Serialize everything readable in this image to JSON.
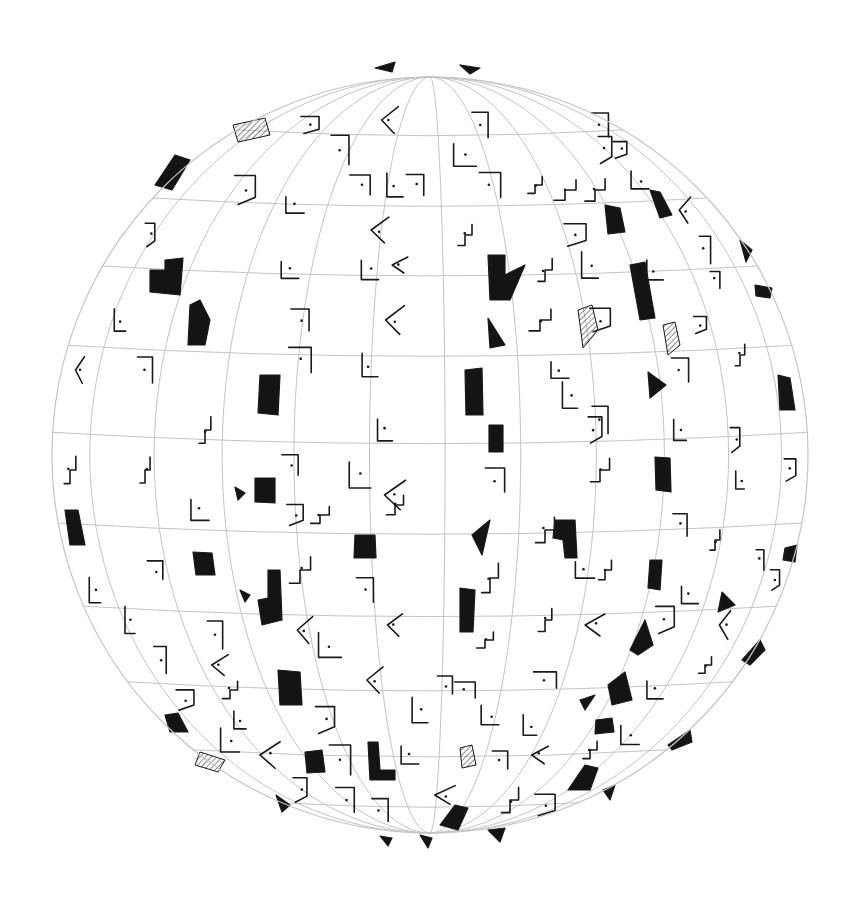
{
  "artwork": {
    "subject": "pencil sketch of a sphere with latitude/longitude grid and scattered geometric marks",
    "colors": {
      "background": "#ffffff",
      "grid": "#c4c4c4",
      "ink": "#1a1a1a",
      "fill": "#141414"
    },
    "sphere": {
      "cx": 430,
      "cy": 455,
      "r": 378
    },
    "latitudes": [
      -0.86,
      -0.68,
      -0.5,
      -0.29,
      -0.06,
      0.18,
      0.4,
      0.6,
      0.78,
      0.92
    ],
    "longitudes": [
      -0.9,
      -0.73,
      -0.55,
      -0.36,
      -0.16,
      0.04,
      0.24,
      0.44,
      0.62,
      0.79,
      0.93
    ],
    "filled_shapes": [
      [
        [
          155,
          185
        ],
        [
          175,
          155
        ],
        [
          190,
          160
        ],
        [
          172,
          190
        ]
      ],
      [
        [
          150,
          270
        ],
        [
          165,
          270
        ],
        [
          165,
          260
        ],
        [
          183,
          258
        ],
        [
          180,
          295
        ],
        [
          150,
          292
        ]
      ],
      [
        [
          190,
          305
        ],
        [
          200,
          300
        ],
        [
          210,
          320
        ],
        [
          205,
          345
        ],
        [
          188,
          345
        ]
      ],
      [
        [
          260,
          375
        ],
        [
          280,
          375
        ],
        [
          278,
          415
        ],
        [
          258,
          413
        ]
      ],
      [
        [
          255,
          478
        ],
        [
          275,
          478
        ],
        [
          275,
          503
        ],
        [
          255,
          502
        ]
      ],
      [
        [
          65,
          510
        ],
        [
          78,
          510
        ],
        [
          85,
          545
        ],
        [
          70,
          545
        ]
      ],
      [
        [
          193,
          552
        ],
        [
          212,
          553
        ],
        [
          215,
          575
        ],
        [
          196,
          575
        ]
      ],
      [
        [
          355,
          535
        ],
        [
          375,
          535
        ],
        [
          376,
          558
        ],
        [
          354,
          558
        ]
      ],
      [
        [
          268,
          570
        ],
        [
          280,
          570
        ],
        [
          282,
          620
        ],
        [
          262,
          625
        ],
        [
          258,
          600
        ],
        [
          268,
          598
        ]
      ],
      [
        [
          278,
          670
        ],
        [
          300,
          672
        ],
        [
          302,
          705
        ],
        [
          280,
          705
        ]
      ],
      [
        [
          465,
          370
        ],
        [
          482,
          368
        ],
        [
          483,
          415
        ],
        [
          466,
          415
        ]
      ],
      [
        [
          489,
          425
        ],
        [
          503,
          425
        ],
        [
          503,
          452
        ],
        [
          489,
          452
        ]
      ],
      [
        [
          488,
          255
        ],
        [
          505,
          255
        ],
        [
          505,
          275
        ],
        [
          525,
          265
        ],
        [
          510,
          300
        ],
        [
          490,
          300
        ]
      ],
      [
        [
          488,
          318
        ],
        [
          505,
          345
        ],
        [
          490,
          348
        ]
      ],
      [
        [
          490,
          520
        ],
        [
          472,
          535
        ],
        [
          482,
          555
        ]
      ],
      [
        [
          555,
          520
        ],
        [
          575,
          520
        ],
        [
          577,
          558
        ],
        [
          565,
          558
        ],
        [
          563,
          540
        ],
        [
          553,
          538
        ]
      ],
      [
        [
          460,
          588
        ],
        [
          475,
          590
        ],
        [
          473,
          632
        ],
        [
          460,
          632
        ]
      ],
      [
        [
          648,
          372
        ],
        [
          666,
          385
        ],
        [
          650,
          398
        ]
      ],
      [
        [
          655,
          457
        ],
        [
          670,
          458
        ],
        [
          671,
          492
        ],
        [
          656,
          490
        ]
      ],
      [
        [
          650,
          560
        ],
        [
          662,
          560
        ],
        [
          660,
          590
        ],
        [
          648,
          588
        ]
      ],
      [
        [
          630,
          650
        ],
        [
          645,
          620
        ],
        [
          653,
          645
        ],
        [
          638,
          655
        ]
      ],
      [
        [
          722,
          592
        ],
        [
          735,
          605
        ],
        [
          718,
          612
        ]
      ],
      [
        [
          778,
          375
        ],
        [
          790,
          378
        ],
        [
          795,
          410
        ],
        [
          780,
          410
        ]
      ],
      [
        [
          785,
          548
        ],
        [
          797,
          545
        ],
        [
          795,
          562
        ],
        [
          783,
          560
        ]
      ],
      [
        [
          605,
          205
        ],
        [
          620,
          208
        ],
        [
          625,
          232
        ],
        [
          608,
          234
        ]
      ],
      [
        [
          650,
          190
        ],
        [
          660,
          192
        ],
        [
          672,
          215
        ],
        [
          660,
          218
        ]
      ],
      [
        [
          630,
          265
        ],
        [
          645,
          262
        ],
        [
          655,
          318
        ],
        [
          640,
          320
        ]
      ],
      [
        [
          740,
          240
        ],
        [
          752,
          250
        ],
        [
          746,
          262
        ]
      ],
      [
        [
          755,
          285
        ],
        [
          772,
          288
        ],
        [
          770,
          298
        ],
        [
          756,
          296
        ]
      ],
      [
        [
          608,
          685
        ],
        [
          625,
          672
        ],
        [
          632,
          700
        ],
        [
          612,
          705
        ]
      ],
      [
        [
          596,
          720
        ],
        [
          612,
          718
        ],
        [
          614,
          732
        ],
        [
          595,
          734
        ]
      ],
      [
        [
          580,
          700
        ],
        [
          595,
          695
        ],
        [
          585,
          710
        ]
      ],
      [
        [
          568,
          790
        ],
        [
          585,
          765
        ],
        [
          598,
          768
        ],
        [
          590,
          790
        ]
      ],
      [
        [
          603,
          790
        ],
        [
          615,
          785
        ],
        [
          610,
          800
        ]
      ],
      [
        [
          742,
          660
        ],
        [
          760,
          640
        ],
        [
          765,
          650
        ],
        [
          750,
          665
        ]
      ],
      [
        [
          668,
          745
        ],
        [
          690,
          730
        ],
        [
          692,
          742
        ],
        [
          672,
          750
        ]
      ],
      [
        [
          368,
          742
        ],
        [
          378,
          742
        ],
        [
          380,
          770
        ],
        [
          395,
          770
        ],
        [
          395,
          780
        ],
        [
          370,
          780
        ]
      ],
      [
        [
          305,
          752
        ],
        [
          322,
          750
        ],
        [
          325,
          772
        ],
        [
          307,
          773
        ]
      ],
      [
        [
          165,
          715
        ],
        [
          178,
          713
        ],
        [
          188,
          732
        ],
        [
          170,
          732
        ]
      ],
      [
        [
          240,
          590
        ],
        [
          250,
          595
        ],
        [
          245,
          602
        ]
      ],
      [
        [
          235,
          487
        ],
        [
          245,
          493
        ],
        [
          238,
          500
        ]
      ],
      [
        [
          440,
          825
        ],
        [
          455,
          805
        ],
        [
          468,
          808
        ],
        [
          458,
          830
        ]
      ],
      [
        [
          420,
          835
        ],
        [
          432,
          838
        ],
        [
          428,
          848
        ]
      ],
      [
        [
          488,
          830
        ],
        [
          505,
          828
        ],
        [
          500,
          842
        ]
      ],
      [
        [
          375,
          68
        ],
        [
          395,
          62
        ],
        [
          392,
          72
        ]
      ],
      [
        [
          460,
          65
        ],
        [
          480,
          68
        ],
        [
          470,
          74
        ]
      ],
      [
        [
          276,
          795
        ],
        [
          290,
          805
        ],
        [
          282,
          812
        ]
      ],
      [
        [
          380,
          836
        ],
        [
          392,
          838
        ],
        [
          388,
          846
        ]
      ]
    ],
    "hatched_shapes": [
      [
        [
          578,
          310
        ],
        [
          592,
          305
        ],
        [
          598,
          330
        ],
        [
          583,
          348
        ]
      ],
      [
        [
          663,
          325
        ],
        [
          675,
          322
        ],
        [
          680,
          345
        ],
        [
          668,
          355
        ]
      ],
      [
        [
          233,
          125
        ],
        [
          265,
          118
        ],
        [
          270,
          135
        ],
        [
          238,
          142
        ]
      ],
      [
        [
          460,
          748
        ],
        [
          472,
          745
        ],
        [
          476,
          765
        ],
        [
          462,
          768
        ]
      ],
      [
        [
          200,
          752
        ],
        [
          225,
          760
        ],
        [
          218,
          772
        ],
        [
          195,
          765
        ]
      ]
    ],
    "glyph_marks": [
      [
        340,
        75
      ],
      [
        380,
        85
      ],
      [
        420,
        80
      ],
      [
        490,
        85
      ],
      [
        515,
        90
      ],
      [
        550,
        95
      ],
      [
        580,
        110
      ],
      [
        600,
        125
      ],
      [
        310,
        125
      ],
      [
        390,
        120
      ],
      [
        480,
        125
      ],
      [
        620,
        150
      ],
      [
        660,
        160
      ],
      [
        700,
        190
      ],
      [
        340,
        150
      ],
      [
        360,
        185
      ],
      [
        395,
        185
      ],
      [
        415,
        185
      ],
      [
        465,
        155
      ],
      [
        490,
        185
      ],
      [
        535,
        185
      ],
      [
        565,
        190
      ],
      [
        595,
        190
      ],
      [
        640,
        180
      ],
      [
        245,
        190
      ],
      [
        295,
        205
      ],
      [
        380,
        230
      ],
      [
        465,
        235
      ],
      [
        575,
        235
      ],
      [
        605,
        150
      ],
      [
        685,
        210
      ],
      [
        705,
        250
      ],
      [
        150,
        235
      ],
      [
        290,
        270
      ],
      [
        370,
        270
      ],
      [
        400,
        265
      ],
      [
        545,
        270
      ],
      [
        590,
        265
      ],
      [
        655,
        270
      ],
      [
        715,
        280
      ],
      [
        95,
        285
      ],
      [
        120,
        320
      ],
      [
        300,
        320
      ],
      [
        395,
        320
      ],
      [
        540,
        320
      ],
      [
        600,
        320
      ],
      [
        700,
        325
      ],
      [
        80,
        370
      ],
      [
        145,
        370
      ],
      [
        300,
        360
      ],
      [
        370,
        365
      ],
      [
        560,
        370
      ],
      [
        570,
        395
      ],
      [
        600,
        420
      ],
      [
        680,
        370
      ],
      [
        740,
        355
      ],
      [
        205,
        430
      ],
      [
        385,
        430
      ],
      [
        595,
        430
      ],
      [
        680,
        430
      ],
      [
        735,
        440
      ],
      [
        70,
        470
      ],
      [
        145,
        470
      ],
      [
        290,
        465
      ],
      [
        360,
        475
      ],
      [
        395,
        495
      ],
      [
        495,
        480
      ],
      [
        600,
        470
      ],
      [
        740,
        480
      ],
      [
        790,
        470
      ],
      [
        200,
        510
      ],
      [
        295,
        515
      ],
      [
        320,
        515
      ],
      [
        395,
        505
      ],
      [
        545,
        530
      ],
      [
        680,
        525
      ],
      [
        715,
        540
      ],
      [
        155,
        570
      ],
      [
        300,
        570
      ],
      [
        365,
        590
      ],
      [
        490,
        578
      ],
      [
        585,
        570
      ],
      [
        605,
        570
      ],
      [
        690,
        595
      ],
      [
        760,
        560
      ],
      [
        775,
        580
      ],
      [
        95,
        590
      ],
      [
        130,
        620
      ],
      [
        215,
        635
      ],
      [
        305,
        630
      ],
      [
        395,
        625
      ],
      [
        485,
        640
      ],
      [
        545,
        620
      ],
      [
        595,
        625
      ],
      [
        665,
        620
      ],
      [
        725,
        625
      ],
      [
        160,
        660
      ],
      [
        220,
        665
      ],
      [
        230,
        690
      ],
      [
        330,
        645
      ],
      [
        375,
        680
      ],
      [
        445,
        685
      ],
      [
        465,
        690
      ],
      [
        545,
        680
      ],
      [
        655,
        690
      ],
      [
        705,
        665
      ],
      [
        185,
        700
      ],
      [
        240,
        720
      ],
      [
        325,
        720
      ],
      [
        420,
        710
      ],
      [
        490,
        715
      ],
      [
        530,
        725
      ],
      [
        630,
        735
      ],
      [
        700,
        720
      ],
      [
        230,
        740
      ],
      [
        270,
        755
      ],
      [
        340,
        760
      ],
      [
        410,
        755
      ],
      [
        500,
        760
      ],
      [
        540,
        755
      ],
      [
        590,
        750
      ],
      [
        640,
        765
      ],
      [
        700,
        760
      ],
      [
        255,
        800
      ],
      [
        300,
        790
      ],
      [
        345,
        800
      ],
      [
        380,
        810
      ],
      [
        445,
        795
      ],
      [
        510,
        800
      ],
      [
        545,
        805
      ],
      [
        570,
        820
      ],
      [
        330,
        830
      ],
      [
        390,
        835
      ],
      [
        510,
        832
      ]
    ]
  }
}
